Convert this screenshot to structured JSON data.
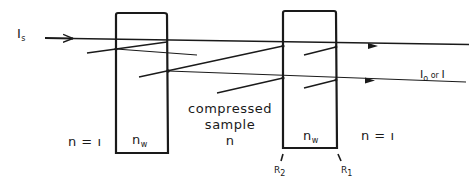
{
  "labels": {
    "incident": {
      "main": "I",
      "sub": "s"
    },
    "output": {
      "main1": "I",
      "sub1": "o",
      "mid": " or ",
      "main2": "I"
    },
    "n_left": "n = ı",
    "n_right": "n = ı",
    "window_left": {
      "main": "n",
      "sub": "w"
    },
    "window_right": {
      "main": "n",
      "sub": "w"
    },
    "sample_line1": "compressed",
    "sample_line2": "sample",
    "sample_line3": "n",
    "r2": {
      "main": "R",
      "sub": "2"
    },
    "r1": {
      "main": "R",
      "sub": "1"
    }
  },
  "colors": {
    "stroke": "#1a1a1a",
    "background": "#ffffff"
  }
}
